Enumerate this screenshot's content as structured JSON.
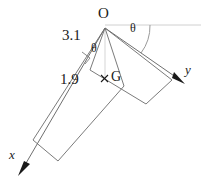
{
  "figure": {
    "background_color": "#ffffff",
    "line_color": "#6b6b6b",
    "faint_line_color": "#c9c9c9",
    "text_color": "#1a1a1a",
    "labels": {
      "origin": "O",
      "centroid": "G",
      "centroid_marker": "×",
      "axis_x": "x",
      "axis_y": "y",
      "angle_top": "θ",
      "angle_inner": "θ",
      "dimension_long": "3.1",
      "dimension_short": "1.9"
    },
    "geometry": {
      "origin_point": [
        105,
        28
      ],
      "centroid_point": [
        105,
        79
      ],
      "x_axis_arrow_tip": [
        18,
        176
      ],
      "y_axis_arrow_tip": [
        185,
        84
      ],
      "reference_line_end": [
        201,
        25
      ],
      "arm_long_outer_end": [
        33,
        140
      ],
      "arm_long_width_end": [
        58,
        161
      ],
      "arm_short_outer_end": [
        172,
        80
      ],
      "arm_short_width_end": [
        146,
        104
      ]
    }
  }
}
